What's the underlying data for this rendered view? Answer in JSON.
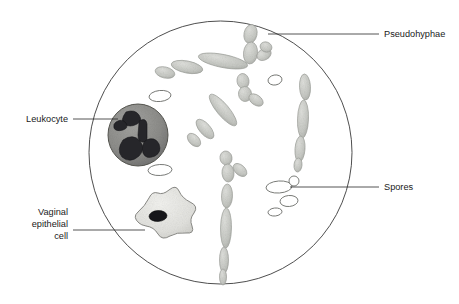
{
  "figure": {
    "field_shape": "circle",
    "background_color": "#ffffff",
    "outline_color": "#3a3a3a"
  },
  "labels": [
    {
      "id": "pseudohyphae",
      "text": "Pseudohyphae",
      "lines": [
        "Pseudohyphae"
      ],
      "anchor": "start",
      "side": "right",
      "text_x": 384,
      "text_y": 37,
      "leader_from_x": 379,
      "leader_from_y": 34,
      "leader_to_x": 268,
      "leader_to_y": 34
    },
    {
      "id": "spores",
      "text": "Spores",
      "lines": [
        "Spores"
      ],
      "anchor": "start",
      "side": "right",
      "text_x": 384,
      "text_y": 190,
      "leader_from_x": 379,
      "leader_from_y": 187,
      "leader_to_x": 290,
      "leader_to_y": 187
    },
    {
      "id": "leukocyte",
      "text": "Leukocyte",
      "lines": [
        "Leukocyte"
      ],
      "anchor": "end",
      "side": "left",
      "text_x": 68,
      "text_y": 122,
      "leader_from_x": 73,
      "leader_from_y": 119,
      "leader_to_x": 118,
      "leader_to_y": 119
    },
    {
      "id": "vaginal-epithelial-cell",
      "text": "Vaginal epithelial cell",
      "lines": [
        "Vaginal",
        "epithelial",
        "cell"
      ],
      "anchor": "end",
      "side": "left",
      "text_x": 68,
      "text_y": 221,
      "leader_from_x": 73,
      "leader_from_y": 230,
      "leader_to_x": 145,
      "leader_to_y": 230
    }
  ],
  "colors": {
    "outline": "#3a3a3a",
    "hypha_fill": "#c9cbc6",
    "hypha_stroke": "#9a9c98",
    "spore_stroke": "#6e706c",
    "spore_fill": "#ffffff",
    "leukocyte_fill": "#8d8d8a",
    "leukocyte_stroke": "#55554f",
    "leukocyte_nucleus": "#2a2a28",
    "epithelial_fill": "#e4e4e0",
    "epithelial_stroke": "#8a8a86",
    "epithelial_nucleus": "#16161a",
    "text": "#1a1a1a"
  },
  "structures": {
    "pseudohyphae_count": 4,
    "spores_count": 7,
    "leukocyte_count": 1,
    "epithelial_cell_count": 1
  }
}
